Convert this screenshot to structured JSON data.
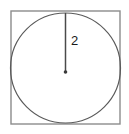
{
  "figure": {
    "type": "geometry-diagram",
    "canvas": {
      "width": 129,
      "height": 134,
      "background": "#ffffff"
    },
    "square": {
      "name": "bounding-square",
      "x": 11,
      "y": 11,
      "width": 109,
      "height": 113,
      "stroke": "#8c8c8c",
      "stroke_width": 1.4,
      "fill": "none"
    },
    "circle": {
      "name": "inscribed-circle",
      "cx": 65.5,
      "cy": 68,
      "r": 55,
      "stroke": "#5a5a5a",
      "stroke_width": 1.2,
      "fill": "none"
    },
    "radius_segment": {
      "name": "radius-line",
      "x1": 65.5,
      "y1": 13,
      "x2": 65.5,
      "y2": 72,
      "stroke": "#4a4a4a",
      "stroke_width": 1.5
    },
    "center_point": {
      "name": "center-dot",
      "cx": 65.5,
      "cy": 72,
      "r": 1.8,
      "fill": "#3a3a3a"
    },
    "labels": [
      {
        "name": "radius-length-label",
        "text": "2",
        "x": 71,
        "y": 42,
        "color": "#1a1a1a",
        "font_size": 13
      }
    ]
  }
}
